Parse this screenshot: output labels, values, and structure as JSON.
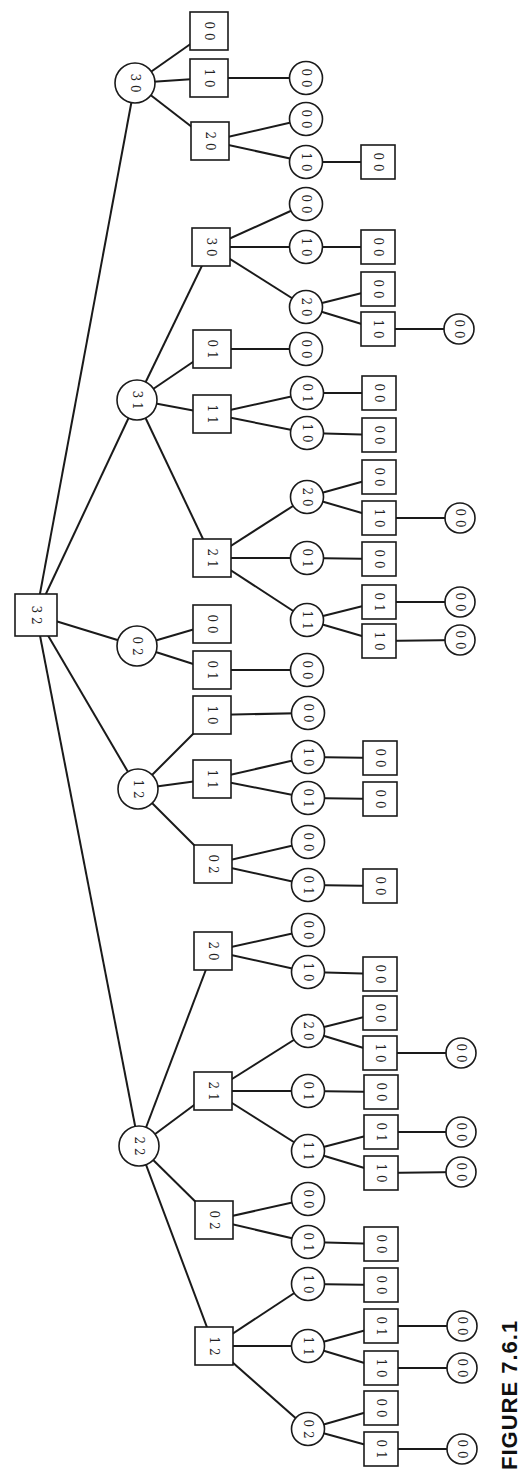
{
  "figure": {
    "caption": "FIGURE 7.6.1"
  },
  "colors": {
    "stroke": "#1a1a1a",
    "fill": "#ffffff",
    "text": "#222222"
  },
  "nodes": [
    {
      "id": "root",
      "shape": "square",
      "label": [
        "3",
        "2"
      ],
      "x": 36,
      "y": 615,
      "size": 42
    },
    {
      "id": "a",
      "shape": "circle",
      "label": [
        "3",
        "0"
      ],
      "x": 135,
      "y": 83,
      "parent": "root"
    },
    {
      "id": "a1",
      "shape": "square",
      "label": [
        "0",
        "0"
      ],
      "x": 209,
      "y": 31,
      "parent": "a"
    },
    {
      "id": "a2",
      "shape": "square",
      "label": [
        "1",
        "0"
      ],
      "x": 209,
      "y": 78,
      "parent": "a"
    },
    {
      "id": "a2a",
      "shape": "circle",
      "label": [
        "0",
        "0"
      ],
      "x": 306,
      "y": 78,
      "parent": "a2"
    },
    {
      "id": "a3",
      "shape": "square",
      "label": [
        "2",
        "0"
      ],
      "x": 210,
      "y": 141,
      "parent": "a"
    },
    {
      "id": "a3a",
      "shape": "circle",
      "label": [
        "0",
        "0"
      ],
      "x": 306,
      "y": 119,
      "parent": "a3"
    },
    {
      "id": "a3b",
      "shape": "circle",
      "label": [
        "1",
        "0"
      ],
      "x": 306,
      "y": 162,
      "parent": "a3"
    },
    {
      "id": "a3b1",
      "shape": "square",
      "label": [
        "0",
        "0"
      ],
      "x": 378,
      "y": 162,
      "parent": "a3b"
    },
    {
      "id": "b",
      "shape": "circle",
      "label": [
        "3",
        "1"
      ],
      "x": 137,
      "y": 400,
      "parent": "root"
    },
    {
      "id": "b1",
      "shape": "square",
      "label": [
        "3",
        "0"
      ],
      "x": 211,
      "y": 247,
      "parent": "b"
    },
    {
      "id": "b1a",
      "shape": "circle",
      "label": [
        "0",
        "0"
      ],
      "x": 306,
      "y": 204,
      "parent": "b1"
    },
    {
      "id": "b1b",
      "shape": "circle",
      "label": [
        "1",
        "0"
      ],
      "x": 306,
      "y": 247,
      "parent": "b1"
    },
    {
      "id": "b1b1",
      "shape": "square",
      "label": [
        "0",
        "0"
      ],
      "x": 378,
      "y": 247,
      "parent": "b1b"
    },
    {
      "id": "b1c",
      "shape": "circle",
      "label": [
        "2",
        "0"
      ],
      "x": 306,
      "y": 307,
      "parent": "b1"
    },
    {
      "id": "b1c1",
      "shape": "square",
      "label": [
        "0",
        "0"
      ],
      "x": 378,
      "y": 289,
      "parent": "b1c"
    },
    {
      "id": "b1c2",
      "shape": "square",
      "label": [
        "1",
        "0"
      ],
      "x": 378,
      "y": 329,
      "parent": "b1c"
    },
    {
      "id": "b1c2a",
      "shape": "circle",
      "label": [
        "0",
        "0"
      ],
      "x": 459,
      "y": 329,
      "parent": "b1c2"
    },
    {
      "id": "b2",
      "shape": "square",
      "label": [
        "0",
        "1"
      ],
      "x": 212,
      "y": 349,
      "parent": "b"
    },
    {
      "id": "b2a",
      "shape": "circle",
      "label": [
        "0",
        "0"
      ],
      "x": 306,
      "y": 349,
      "parent": "b2"
    },
    {
      "id": "b3",
      "shape": "square",
      "label": [
        "1",
        "1"
      ],
      "x": 212,
      "y": 414,
      "parent": "b"
    },
    {
      "id": "b3a",
      "shape": "circle",
      "label": [
        "0",
        "1"
      ],
      "x": 307,
      "y": 393,
      "parent": "b3"
    },
    {
      "id": "b3a1",
      "shape": "square",
      "label": [
        "0",
        "0"
      ],
      "x": 379,
      "y": 393,
      "parent": "b3a"
    },
    {
      "id": "b3b",
      "shape": "circle",
      "label": [
        "1",
        "0"
      ],
      "x": 307,
      "y": 433,
      "parent": "b3"
    },
    {
      "id": "b3b1",
      "shape": "square",
      "label": [
        "0",
        "0"
      ],
      "x": 379,
      "y": 435,
      "parent": "b3b"
    },
    {
      "id": "b4",
      "shape": "square",
      "label": [
        "2",
        "1"
      ],
      "x": 212,
      "y": 558,
      "parent": "b"
    },
    {
      "id": "b4a",
      "shape": "circle",
      "label": [
        "2",
        "0"
      ],
      "x": 307,
      "y": 497,
      "parent": "b4"
    },
    {
      "id": "b4a1",
      "shape": "square",
      "label": [
        "0",
        "0"
      ],
      "x": 379,
      "y": 477,
      "parent": "b4a"
    },
    {
      "id": "b4a2",
      "shape": "square",
      "label": [
        "1",
        "0"
      ],
      "x": 379,
      "y": 518,
      "parent": "b4a"
    },
    {
      "id": "b4a2a",
      "shape": "circle",
      "label": [
        "0",
        "0"
      ],
      "x": 460,
      "y": 518,
      "parent": "b4a2"
    },
    {
      "id": "b4b",
      "shape": "circle",
      "label": [
        "0",
        "1"
      ],
      "x": 307,
      "y": 558,
      "parent": "b4"
    },
    {
      "id": "b4b1",
      "shape": "square",
      "label": [
        "0",
        "0"
      ],
      "x": 379,
      "y": 559,
      "parent": "b4b"
    },
    {
      "id": "b4c",
      "shape": "circle",
      "label": [
        "1",
        "1"
      ],
      "x": 307,
      "y": 620,
      "parent": "b4"
    },
    {
      "id": "b4c1",
      "shape": "square",
      "label": [
        "0",
        "1"
      ],
      "x": 379,
      "y": 602,
      "parent": "b4c"
    },
    {
      "id": "b4c1a",
      "shape": "circle",
      "label": [
        "0",
        "0"
      ],
      "x": 460,
      "y": 602,
      "parent": "b4c1"
    },
    {
      "id": "b4c2",
      "shape": "square",
      "label": [
        "1",
        "0"
      ],
      "x": 379,
      "y": 641,
      "parent": "b4c"
    },
    {
      "id": "b4c2a",
      "shape": "circle",
      "label": [
        "0",
        "0"
      ],
      "x": 460,
      "y": 640,
      "parent": "b4c2"
    },
    {
      "id": "c",
      "shape": "circle",
      "label": [
        "0",
        "2"
      ],
      "x": 137,
      "y": 646,
      "parent": "root"
    },
    {
      "id": "c1",
      "shape": "square",
      "label": [
        "0",
        "0"
      ],
      "x": 212,
      "y": 624,
      "parent": "c"
    },
    {
      "id": "c2",
      "shape": "square",
      "label": [
        "0",
        "1"
      ],
      "x": 212,
      "y": 670,
      "parent": "c"
    },
    {
      "id": "c2a",
      "shape": "circle",
      "label": [
        "0",
        "0"
      ],
      "x": 307,
      "y": 670,
      "parent": "c2"
    },
    {
      "id": "d",
      "shape": "circle",
      "label": [
        "1",
        "2"
      ],
      "x": 138,
      "y": 789,
      "parent": "root"
    },
    {
      "id": "d1",
      "shape": "square",
      "label": [
        "1",
        "0"
      ],
      "x": 212,
      "y": 715,
      "parent": "d"
    },
    {
      "id": "d1a",
      "shape": "circle",
      "label": [
        "0",
        "0"
      ],
      "x": 308,
      "y": 713,
      "parent": "d1"
    },
    {
      "id": "d2",
      "shape": "square",
      "label": [
        "1",
        "1"
      ],
      "x": 212,
      "y": 779,
      "parent": "d"
    },
    {
      "id": "d2a",
      "shape": "circle",
      "label": [
        "1",
        "0"
      ],
      "x": 308,
      "y": 757,
      "parent": "d2"
    },
    {
      "id": "d2a1",
      "shape": "square",
      "label": [
        "0",
        "0"
      ],
      "x": 380,
      "y": 758,
      "parent": "d2a"
    },
    {
      "id": "d2b",
      "shape": "circle",
      "label": [
        "0",
        "1"
      ],
      "x": 308,
      "y": 798,
      "parent": "d2"
    },
    {
      "id": "d2b1",
      "shape": "square",
      "label": [
        "0",
        "0"
      ],
      "x": 380,
      "y": 799,
      "parent": "d2b"
    },
    {
      "id": "d3",
      "shape": "square",
      "label": [
        "0",
        "2"
      ],
      "x": 213,
      "y": 864,
      "parent": "d"
    },
    {
      "id": "d3a",
      "shape": "circle",
      "label": [
        "0",
        "0"
      ],
      "x": 308,
      "y": 842,
      "parent": "d3"
    },
    {
      "id": "d3b",
      "shape": "circle",
      "label": [
        "0",
        "1"
      ],
      "x": 308,
      "y": 885,
      "parent": "d3"
    },
    {
      "id": "d3b1",
      "shape": "square",
      "label": [
        "0",
        "0"
      ],
      "x": 380,
      "y": 886,
      "parent": "d3b"
    },
    {
      "id": "e",
      "shape": "circle",
      "label": [
        "2",
        "2"
      ],
      "x": 139,
      "y": 1146,
      "parent": "root"
    },
    {
      "id": "e1",
      "shape": "square",
      "label": [
        "2",
        "0"
      ],
      "x": 213,
      "y": 951,
      "parent": "e"
    },
    {
      "id": "e1a",
      "shape": "circle",
      "label": [
        "0",
        "0"
      ],
      "x": 308,
      "y": 930,
      "parent": "e1"
    },
    {
      "id": "e1b",
      "shape": "circle",
      "label": [
        "1",
        "0"
      ],
      "x": 308,
      "y": 972,
      "parent": "e1"
    },
    {
      "id": "e1b1",
      "shape": "square",
      "label": [
        "0",
        "0"
      ],
      "x": 380,
      "y": 974,
      "parent": "e1b"
    },
    {
      "id": "e2",
      "shape": "square",
      "label": [
        "2",
        "1"
      ],
      "x": 213,
      "y": 1091,
      "parent": "e"
    },
    {
      "id": "e2a",
      "shape": "circle",
      "label": [
        "2",
        "0"
      ],
      "x": 308,
      "y": 1031,
      "parent": "e2"
    },
    {
      "id": "e2a1",
      "shape": "square",
      "label": [
        "0",
        "0"
      ],
      "x": 380,
      "y": 1013,
      "parent": "e2a"
    },
    {
      "id": "e2a2",
      "shape": "square",
      "label": [
        "1",
        "0"
      ],
      "x": 380,
      "y": 1053,
      "parent": "e2a"
    },
    {
      "id": "e2a2a",
      "shape": "circle",
      "label": [
        "0",
        "0"
      ],
      "x": 461,
      "y": 1053,
      "parent": "e2a2"
    },
    {
      "id": "e2b",
      "shape": "circle",
      "label": [
        "0",
        "1"
      ],
      "x": 308,
      "y": 1091,
      "parent": "e2"
    },
    {
      "id": "e2b1",
      "shape": "square",
      "label": [
        "0",
        "0"
      ],
      "x": 381,
      "y": 1092,
      "parent": "e2b"
    },
    {
      "id": "e2c",
      "shape": "circle",
      "label": [
        "1",
        "1"
      ],
      "x": 308,
      "y": 1151,
      "parent": "e2"
    },
    {
      "id": "e2c1",
      "shape": "square",
      "label": [
        "0",
        "1"
      ],
      "x": 381,
      "y": 1132,
      "parent": "e2c"
    },
    {
      "id": "e2c1a",
      "shape": "circle",
      "label": [
        "0",
        "0"
      ],
      "x": 461,
      "y": 1132,
      "parent": "e2c1"
    },
    {
      "id": "e2c2",
      "shape": "square",
      "label": [
        "1",
        "0"
      ],
      "x": 381,
      "y": 1173,
      "parent": "e2c"
    },
    {
      "id": "e2c2a",
      "shape": "circle",
      "label": [
        "0",
        "0"
      ],
      "x": 461,
      "y": 1172,
      "parent": "e2c2"
    },
    {
      "id": "e3",
      "shape": "square",
      "label": [
        "0",
        "2"
      ],
      "x": 214,
      "y": 1220,
      "parent": "e"
    },
    {
      "id": "e3a",
      "shape": "circle",
      "label": [
        "0",
        "0"
      ],
      "x": 308,
      "y": 1199,
      "parent": "e3"
    },
    {
      "id": "e3b",
      "shape": "circle",
      "label": [
        "0",
        "1"
      ],
      "x": 308,
      "y": 1242,
      "parent": "e3"
    },
    {
      "id": "e3b1",
      "shape": "square",
      "label": [
        "0",
        "0"
      ],
      "x": 381,
      "y": 1244,
      "parent": "e3b"
    },
    {
      "id": "e4",
      "shape": "square",
      "label": [
        "1",
        "2"
      ],
      "x": 214,
      "y": 1346,
      "parent": "e"
    },
    {
      "id": "e4a",
      "shape": "circle",
      "label": [
        "1",
        "0"
      ],
      "x": 308,
      "y": 1284,
      "parent": "e4"
    },
    {
      "id": "e4a1",
      "shape": "square",
      "label": [
        "0",
        "0"
      ],
      "x": 381,
      "y": 1285,
      "parent": "e4a"
    },
    {
      "id": "e4b",
      "shape": "circle",
      "label": [
        "1",
        "1"
      ],
      "x": 308,
      "y": 1346,
      "parent": "e4"
    },
    {
      "id": "e4b1",
      "shape": "square",
      "label": [
        "0",
        "1"
      ],
      "x": 381,
      "y": 1326,
      "parent": "e4b"
    },
    {
      "id": "e4b1a",
      "shape": "circle",
      "label": [
        "0",
        "0"
      ],
      "x": 462,
      "y": 1326,
      "parent": "e4b1"
    },
    {
      "id": "e4b2",
      "shape": "square",
      "label": [
        "1",
        "0"
      ],
      "x": 381,
      "y": 1368,
      "parent": "e4b"
    },
    {
      "id": "e4b2a",
      "shape": "circle",
      "label": [
        "0",
        "0"
      ],
      "x": 462,
      "y": 1368,
      "parent": "e4b2"
    },
    {
      "id": "e4c",
      "shape": "circle",
      "label": [
        "0",
        "2"
      ],
      "x": 308,
      "y": 1429,
      "parent": "e4"
    },
    {
      "id": "e4c1",
      "shape": "square",
      "label": [
        "0",
        "0"
      ],
      "x": 381,
      "y": 1408,
      "parent": "e4c"
    },
    {
      "id": "e4c2",
      "shape": "square",
      "label": [
        "0",
        "1"
      ],
      "x": 381,
      "y": 1449,
      "parent": "e4c"
    },
    {
      "id": "e4c2a",
      "shape": "circle",
      "label": [
        "0",
        "0"
      ],
      "x": 462,
      "y": 1449,
      "parent": "e4c2"
    }
  ]
}
